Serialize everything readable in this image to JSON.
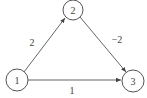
{
  "diagram": {
    "type": "directed-weighted-graph",
    "nodes": [
      {
        "id": "1",
        "label": "1",
        "cx": 17,
        "cy": 80,
        "r": 11
      },
      {
        "id": "2",
        "label": "2",
        "cx": 73,
        "cy": 10,
        "r": 10
      },
      {
        "id": "3",
        "label": "3",
        "cx": 133,
        "cy": 81,
        "r": 11
      }
    ],
    "edges": [
      {
        "from": "1",
        "to": "2",
        "weight": "2"
      },
      {
        "from": "2",
        "to": "3",
        "weight": "−2"
      },
      {
        "from": "1",
        "to": "3",
        "weight": "1"
      }
    ],
    "colors": {
      "stroke": "#555555",
      "text": "#444444",
      "background": "#ffffff"
    }
  }
}
